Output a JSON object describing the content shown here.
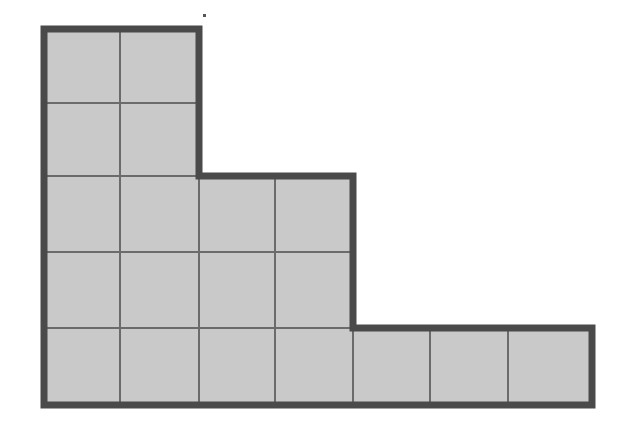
{
  "figure": {
    "shape_name": "staircase-polyomino",
    "background_color": "#FFFFFF",
    "cell_fill_color": "#C9C9C9",
    "outer_border_color": "#4A4A4A",
    "inner_grid_line_color": "#6B6B6B",
    "outer_border_width_px": 7,
    "inner_grid_line_width_px": 2,
    "grid": {
      "columns": 7,
      "rows": 5,
      "cell_width_px": 79,
      "cell_height_px": 76,
      "origin_x_px": 44,
      "origin_y_px": 29
    },
    "row_widths_in_cells": [
      2,
      2,
      4,
      4,
      7
    ],
    "total_unit_squares": 19,
    "column_x_boundaries_px": [
      44,
      120,
      199,
      275,
      353,
      430,
      508,
      592
    ],
    "row_y_boundaries_px": [
      29,
      103,
      176,
      252,
      328,
      405
    ],
    "outline_points_px": [
      [
        44,
        29
      ],
      [
        199,
        29
      ],
      [
        199,
        176
      ],
      [
        353,
        176
      ],
      [
        353,
        328
      ],
      [
        592,
        328
      ],
      [
        592,
        405
      ],
      [
        44,
        405
      ]
    ],
    "cells": [
      {
        "row": 1,
        "col": 1,
        "label": ""
      },
      {
        "row": 1,
        "col": 2,
        "label": ""
      },
      {
        "row": 2,
        "col": 1,
        "label": ""
      },
      {
        "row": 2,
        "col": 2,
        "label": ""
      },
      {
        "row": 3,
        "col": 1,
        "label": ""
      },
      {
        "row": 3,
        "col": 2,
        "label": ""
      },
      {
        "row": 3,
        "col": 3,
        "label": ""
      },
      {
        "row": 3,
        "col": 4,
        "label": ""
      },
      {
        "row": 4,
        "col": 1,
        "label": ""
      },
      {
        "row": 4,
        "col": 2,
        "label": ""
      },
      {
        "row": 4,
        "col": 3,
        "label": ""
      },
      {
        "row": 4,
        "col": 4,
        "label": ""
      },
      {
        "row": 5,
        "col": 1,
        "label": ""
      },
      {
        "row": 5,
        "col": 2,
        "label": ""
      },
      {
        "row": 5,
        "col": 3,
        "label": ""
      },
      {
        "row": 5,
        "col": 4,
        "label": ""
      },
      {
        "row": 5,
        "col": 5,
        "label": ""
      },
      {
        "row": 5,
        "col": 6,
        "label": ""
      },
      {
        "row": 5,
        "col": 7,
        "label": ""
      }
    ],
    "artifact_speck": {
      "x_px": 203,
      "y_px": 14,
      "size_px": 3,
      "color": "#555555"
    }
  }
}
